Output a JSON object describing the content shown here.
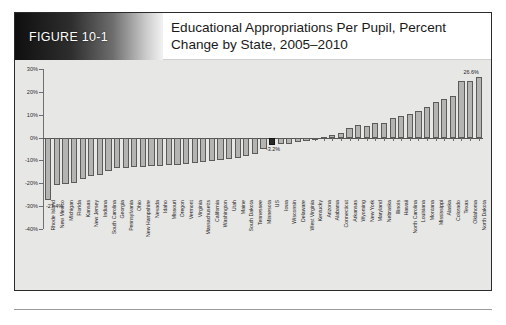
{
  "figure": {
    "tag": "FIGURE 10-1",
    "title": "Educational Appropriations Per Pupil, Percent Change by State, 2005–2010"
  },
  "colors": {
    "bar_fill": "#b4b4b2",
    "bar_stroke": "#5b5b59",
    "highlight_fill": "#2a2a28",
    "panel_bg": "#e7e7e5",
    "axis": "#6f6f6f"
  },
  "annotations": {
    "min_label": "-27.4%",
    "us_label": "-3.2%",
    "max_label": "26.6%"
  },
  "chart_data": {
    "type": "bar",
    "title": "Educational Appropriations Per Pupil, Percent Change by State, 2005–2010",
    "xlabel": "",
    "ylabel": "",
    "ylim": [
      -40,
      30
    ],
    "ytick_labels": [
      "30%",
      "20%",
      "10%",
      "0%",
      "-10%",
      "-20%",
      "-30%",
      "-40%"
    ],
    "yticks": [
      30,
      20,
      10,
      0,
      -10,
      -20,
      -30,
      -40
    ],
    "grid": false,
    "legend": "none",
    "highlight_category": "US",
    "categories": [
      "Rhode Island",
      "New Mexico",
      "Michigan",
      "Florida",
      "Kansas",
      "New Jersey",
      "Indiana",
      "South Carolina",
      "Georgia",
      "Pennsylvania",
      "Ohio",
      "New Hampshire",
      "Nevada",
      "Idaho",
      "Missouri",
      "Oregon",
      "Vermont",
      "Virginia",
      "Massachusetts",
      "California",
      "Washington",
      "Utah",
      "Maine",
      "South Dakota",
      "Tennessee",
      "Minnesota",
      "US",
      "Iowa",
      "Wisconsin",
      "Delaware",
      "West Virginia",
      "Kentucky",
      "Arizona",
      "Alabama",
      "Connecticut",
      "Arkansas",
      "Wyoming",
      "New York",
      "Maryland",
      "Nebraska",
      "Illinois",
      "Hawaii",
      "North Carolina",
      "Louisiana",
      "Montana",
      "Mississippi",
      "Alaska",
      "Colorado",
      "Texas",
      "Oklahoma",
      "North Dakota"
    ],
    "values": [
      -27.4,
      -20.6,
      -20.1,
      -19.9,
      -18.0,
      -16.8,
      -16.4,
      -14.8,
      -13.5,
      -13.3,
      -13.0,
      -12.8,
      -12.6,
      -12.4,
      -12.2,
      -12.0,
      -11.6,
      -11.2,
      -10.6,
      -10.2,
      -9.8,
      -9.4,
      -9.0,
      -8.0,
      -7.0,
      -5.2,
      -3.2,
      -3.0,
      -2.6,
      -2.0,
      -1.4,
      -0.6,
      0.4,
      1.2,
      2.0,
      4.2,
      5.4,
      5.2,
      6.4,
      6.2,
      8.4,
      9.4,
      10.4,
      11.6,
      13.4,
      15.4,
      17.0,
      18.2,
      24.6,
      24.8,
      26.6
    ],
    "labeled_points": [
      {
        "category": "Rhode Island",
        "label": "-27.4%"
      },
      {
        "category": "US",
        "label": "-3.2%"
      },
      {
        "category": "North Dakota",
        "label": "26.6%"
      }
    ]
  }
}
